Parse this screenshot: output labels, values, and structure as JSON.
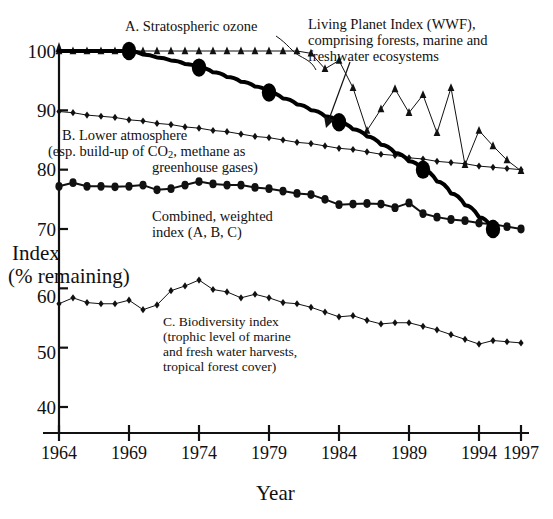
{
  "chart_data": {
    "type": "line",
    "title": "",
    "xlabel": "Year",
    "ylabel": "Index (% remaining)",
    "xlim": [
      1964,
      1997
    ],
    "ylim": [
      38,
      101
    ],
    "grid": false,
    "legend_position": "inline-annotations",
    "x_ticks": [
      "1964",
      "1969",
      "1974",
      "1979",
      "1984",
      "1989",
      "1994",
      "1997"
    ],
    "x_tick_values": [
      1964,
      1969,
      1974,
      1979,
      1984,
      1989,
      1994,
      1997
    ],
    "y_ticks": [
      "40",
      "50",
      "60",
      "70",
      "80",
      "90",
      "100"
    ],
    "y_tick_values": [
      40,
      50,
      60,
      70,
      80,
      90,
      100
    ],
    "x": [
      1964,
      1965,
      1966,
      1967,
      1968,
      1969,
      1970,
      1971,
      1972,
      1973,
      1974,
      1975,
      1976,
      1977,
      1978,
      1979,
      1980,
      1981,
      1982,
      1983,
      1984,
      1985,
      1986,
      1987,
      1988,
      1989,
      1990,
      1991,
      1992,
      1993,
      1994,
      1995,
      1996,
      1997
    ],
    "series": [
      {
        "name": "A. Stratospheric ozone",
        "marker": "triangle",
        "line_width": 1,
        "color": "#111111",
        "values": [
          100,
          100,
          100,
          100,
          100,
          100,
          100,
          100,
          100,
          100,
          100,
          100,
          100,
          100,
          100,
          100,
          100,
          100,
          99.6,
          97.0,
          98.4,
          93.8,
          86.6,
          90.2,
          93.6,
          89.6,
          92.6,
          86.2,
          93.8,
          80.8,
          86.6,
          84.0,
          81.6,
          79.8
        ]
      },
      {
        "name": "B. Lower atmosphere (esp. build-up of CO2, methane as greenhouse gases)",
        "marker": "diamond",
        "line_width": 1,
        "color": "#111111",
        "values": [
          89.8,
          89.6,
          89.2,
          89.0,
          88.8,
          88.4,
          88.2,
          87.8,
          87.6,
          87.2,
          87.0,
          86.6,
          86.4,
          86.0,
          85.6,
          85.4,
          85.0,
          84.6,
          84.4,
          84.0,
          83.6,
          83.4,
          83.0,
          82.6,
          82.4,
          82.0,
          81.8,
          81.4,
          81.2,
          81.0,
          80.6,
          80.4,
          80.2,
          80.0
        ]
      },
      {
        "name": "Combined, weighted index (A, B, C)",
        "marker": "circle",
        "line_width": 2,
        "color": "#111111",
        "values": [
          77.2,
          77.8,
          77.2,
          77.2,
          77.1,
          77.2,
          77.4,
          76.6,
          76.8,
          77.4,
          78.0,
          77.6,
          77.4,
          77.4,
          77.0,
          76.8,
          76.4,
          76.0,
          75.8,
          75.0,
          74.1,
          74.2,
          74.3,
          74.2,
          73.6,
          74.4,
          72.6,
          72.0,
          71.6,
          71.4,
          71.0,
          70.8,
          70.4,
          70.0
        ]
      },
      {
        "name": "C. Biodiversity index (trophic level of marine and fresh water harvests, tropical forest cover)",
        "marker": "diamond",
        "line_width": 1,
        "color": "#111111",
        "values": [
          57.4,
          58.4,
          57.6,
          57.4,
          57.4,
          58.0,
          56.4,
          57.2,
          59.6,
          60.4,
          61.4,
          59.8,
          59.4,
          58.4,
          59.0,
          58.4,
          57.6,
          57.4,
          56.8,
          56.0,
          55.2,
          55.4,
          54.6,
          54.0,
          54.2,
          54.2,
          53.6,
          53.0,
          52.2,
          51.4,
          50.6,
          51.2,
          51.0,
          50.8
        ]
      },
      {
        "name": "Living Planet Index (WWF), comprising forests, marine and freshwater ecosystems",
        "marker": "big-dot",
        "line_width": 4,
        "color": "#000000",
        "values": [
          100,
          100,
          100,
          100,
          100,
          100,
          99.4,
          98.9,
          98.4,
          97.8,
          97.2,
          96.4,
          95.6,
          94.8,
          94.0,
          93.0,
          92.0,
          91.0,
          90.0,
          89.0,
          88.0,
          86.8,
          85.6,
          84.2,
          82.8,
          81.4,
          80.0,
          78.0,
          76.0,
          74.0,
          72.0,
          70.0,
          null,
          null
        ],
        "highlight_points": [
          {
            "x": 1969,
            "y": 100
          },
          {
            "x": 1974,
            "y": 97.2
          },
          {
            "x": 1979,
            "y": 93.0
          },
          {
            "x": 1984,
            "y": 88.0
          },
          {
            "x": 1990,
            "y": 80.0
          },
          {
            "x": 1995,
            "y": 70.0
          }
        ]
      }
    ],
    "annotations": [
      {
        "id": "ann-ozone",
        "text": "A. Stratospheric ozone"
      },
      {
        "id": "ann-lpi-l1",
        "text": "Living Planet Index (WWF),"
      },
      {
        "id": "ann-lpi-l2",
        "text": "comprising forests, marine and"
      },
      {
        "id": "ann-lpi-l3",
        "text": "freshwater ecosystems"
      },
      {
        "id": "ann-b-l1",
        "text": "B. Lower atmosphere"
      },
      {
        "id": "ann-b-l2",
        "text": "(esp. build-up of CO2, methane as"
      },
      {
        "id": "ann-b-l3",
        "text": "greenhouse gases)"
      },
      {
        "id": "ann-comb-l1",
        "text": "Combined, weighted"
      },
      {
        "id": "ann-comb-l2",
        "text": "index (A, B, C)"
      },
      {
        "id": "ann-c-l1",
        "text": "C. Biodiversity index"
      },
      {
        "id": "ann-c-l2",
        "text": "(trophic level of marine"
      },
      {
        "id": "ann-c-l3",
        "text": "and fresh water harvests,"
      },
      {
        "id": "ann-c-l4",
        "text": "tropical forest cover)"
      }
    ]
  },
  "axis": {
    "y_title_line1": "Index",
    "y_title_line2": "(% remaining)",
    "x_title": "Year"
  },
  "annotations_text": {
    "ozone": "A. Stratospheric ozone",
    "lpi_1": "Living Planet Index (WWF),",
    "lpi_2": "comprising forests, marine and",
    "lpi_3": "freshwater ecosystems",
    "b_1": "B. Lower atmosphere",
    "b_2a": "(esp. build-up of CO",
    "b_2sub": "2",
    "b_2b": ", methane as",
    "b_3": "greenhouse gases)",
    "comb_1": "Combined, weighted",
    "comb_2": "index (A, B, C)",
    "c_1": "C. Biodiversity index",
    "c_2": "(trophic level of marine",
    "c_3": "and fresh water harvests,",
    "c_4": "tropical forest cover)"
  },
  "ticks": {
    "y": [
      "100",
      "90",
      "80",
      "70",
      "60",
      "50",
      "40"
    ],
    "x": [
      "1964",
      "1969",
      "1974",
      "1979",
      "1984",
      "1989",
      "1994",
      "1997"
    ]
  }
}
